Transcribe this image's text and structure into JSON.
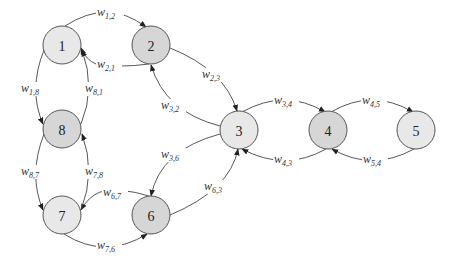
{
  "diagram": {
    "type": "directed-graph",
    "colors": {
      "node_fill_light": "#e8e8e8",
      "node_fill_dark": "#d6d6d6",
      "node_stroke": "#555555",
      "edge": "#444444",
      "background": "#ffffff"
    },
    "nodes": [
      {
        "id": "1",
        "label": "1",
        "cx": 62,
        "cy": 45,
        "shade": "light"
      },
      {
        "id": "2",
        "label": "2",
        "cx": 151,
        "cy": 45,
        "shade": "dark"
      },
      {
        "id": "3",
        "label": "3",
        "cx": 239,
        "cy": 130,
        "shade": "light"
      },
      {
        "id": "4",
        "label": "4",
        "cx": 328,
        "cy": 130,
        "shade": "dark"
      },
      {
        "id": "5",
        "label": "5",
        "cx": 416,
        "cy": 130,
        "shade": "light"
      },
      {
        "id": "6",
        "label": "6",
        "cx": 151,
        "cy": 215,
        "shade": "dark"
      },
      {
        "id": "7",
        "label": "7",
        "cx": 62,
        "cy": 215,
        "shade": "light"
      },
      {
        "id": "8",
        "label": "8",
        "cx": 62,
        "cy": 129,
        "shade": "dark"
      }
    ],
    "edges": [
      {
        "from": "1",
        "to": "2",
        "label": "w",
        "sub": "1,2"
      },
      {
        "from": "2",
        "to": "1",
        "label": "w",
        "sub": "2,1"
      },
      {
        "from": "2",
        "to": "3",
        "label": "w",
        "sub": "2,3"
      },
      {
        "from": "3",
        "to": "2",
        "label": "w",
        "sub": "3,2"
      },
      {
        "from": "3",
        "to": "4",
        "label": "w",
        "sub": "3,4"
      },
      {
        "from": "4",
        "to": "3",
        "label": "w",
        "sub": "4,3"
      },
      {
        "from": "4",
        "to": "5",
        "label": "w",
        "sub": "4,5"
      },
      {
        "from": "5",
        "to": "4",
        "label": "w",
        "sub": "5,4"
      },
      {
        "from": "3",
        "to": "6",
        "label": "w",
        "sub": "3,6"
      },
      {
        "from": "6",
        "to": "3",
        "label": "w",
        "sub": "6,3"
      },
      {
        "from": "6",
        "to": "7",
        "label": "w",
        "sub": "6,7"
      },
      {
        "from": "7",
        "to": "6",
        "label": "w",
        "sub": "7,6"
      },
      {
        "from": "1",
        "to": "8",
        "label": "w",
        "sub": "1,8"
      },
      {
        "from": "8",
        "to": "1",
        "label": "w",
        "sub": "8,1"
      },
      {
        "from": "8",
        "to": "7",
        "label": "w",
        "sub": "8,7"
      },
      {
        "from": "7",
        "to": "8",
        "label": "w",
        "sub": "7,8"
      }
    ]
  }
}
